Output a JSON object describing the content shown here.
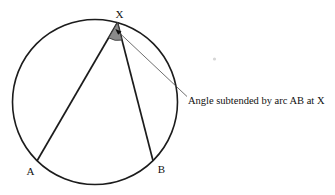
{
  "diagram": {
    "type": "circle-theorem-inscribed-angle",
    "labels": {
      "vertex": "X",
      "point_a": "A",
      "point_b": "B"
    },
    "annotation": "Angle subtended by arc AB at X",
    "colors": {
      "stroke": "#1c1c1c",
      "wedge_fill": "#8a8a8a",
      "wedge_stroke": "#3d3d3d",
      "leader": "#4a4a4a",
      "arrow": "#111111",
      "text": "#111111",
      "stray_dot": "#d6d6d6",
      "background": "#ffffff"
    }
  }
}
